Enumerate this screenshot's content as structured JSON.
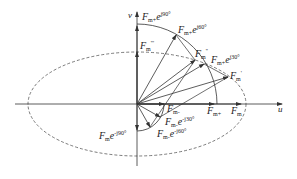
{
  "diagram": {
    "type": "phasor-vector-diagram",
    "axes": {
      "horizontal": "u",
      "vertical": "v"
    },
    "colors": {
      "stroke": "#333333",
      "background": "#ffffff"
    },
    "labels": {
      "fm_plus_e90": {
        "base": "F",
        "sub": "m+",
        "exp": "e",
        "sup": "j90°"
      },
      "fm_plus_e60": {
        "base": "F",
        "sub": "m+",
        "exp": "e",
        "sup": "j60°"
      },
      "fm_plus_e30": {
        "base": "F",
        "sub": "m+",
        "exp": "e",
        "sup": "j30°"
      },
      "fm_triple_prime": {
        "base": "F",
        "sub": "m",
        "sup": "'''"
      },
      "fm_double_prime": {
        "base": "F",
        "sub": "m",
        "sup": "''"
      },
      "fm_prime": {
        "base": "F",
        "sub": "m",
        "sup": "'"
      },
      "fm_minus": {
        "base": "F",
        "sub": "m-"
      },
      "fm_plus": {
        "base": "F",
        "sub": "m+"
      },
      "fm": {
        "base": "F",
        "sub": "m"
      },
      "fm_minus_e_minus30": {
        "base": "F",
        "sub": "m-",
        "exp": "e",
        "sup": "-j30°"
      },
      "fm_minus_e_minus60": {
        "base": "F",
        "sub": "m-",
        "exp": "e",
        "sup": "-j60°"
      },
      "fm_minus_e_minus90": {
        "base": "F",
        "sub": "m",
        "exp": "e",
        "sup": "-j90°"
      }
    }
  }
}
